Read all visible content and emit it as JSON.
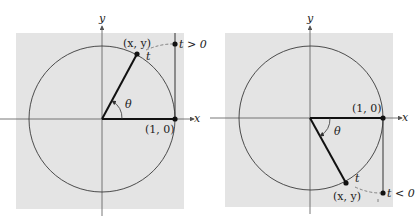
{
  "colors": {
    "panel_bg": "#e4e4e4",
    "axis": "#555555",
    "circle": "#3a3a3a",
    "radius": "#111111",
    "dot": "#111111",
    "dashed": "#777777"
  },
  "left_diagram": {
    "axis_x_label": "x",
    "axis_y_label": "y",
    "point_label": "(x, y)",
    "arc_label": "t",
    "angle_label": "θ",
    "unit_point_label": "(1, 0)",
    "t_label": "t > 0"
  },
  "right_diagram": {
    "axis_x_label": "x",
    "axis_y_label": "y",
    "point_label": "(x, y)",
    "arc_label": "t",
    "angle_label": "θ",
    "unit_point_label": "(1, 0)",
    "t_label": "t < 0"
  }
}
